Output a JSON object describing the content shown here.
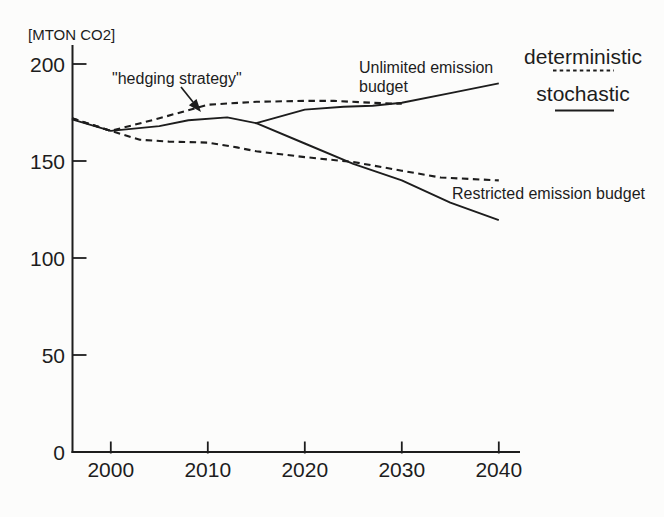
{
  "figure": {
    "paper_color": "#fcfcfb",
    "ink_color": "#1d1d1d",
    "y_axis_unit_label": "[MTON CO2]",
    "annotations": {
      "hedging": "\"hedging strategy\"",
      "unlimited_line1": "Unlimited emission",
      "unlimited_line2": "budget",
      "restricted": "Restricted emission budget"
    },
    "legend": {
      "deterministic_label": "deterministic",
      "stochastic_label": "stochastic"
    }
  },
  "chart_data": {
    "type": "line",
    "title": "",
    "xlabel": "",
    "ylabel": "[MTON CO2]",
    "x_ticks": [
      2000,
      2010,
      2020,
      2030,
      2040
    ],
    "y_ticks": [
      0,
      50,
      100,
      150,
      200
    ],
    "xlim": [
      1996,
      2042
    ],
    "ylim": [
      0,
      209
    ],
    "grid": false,
    "legend_position": "top-right",
    "legend_entries": [
      {
        "label": "deterministic",
        "style": "dashed"
      },
      {
        "label": "stochastic",
        "style": "solid"
      }
    ],
    "series": [
      {
        "name": "deterministic - unlimited emission budget",
        "style": "dashed",
        "x": [
          1996,
          2000,
          2005,
          2010,
          2015,
          2020,
          2023,
          2027,
          2030
        ],
        "y": [
          172,
          165.5,
          172,
          179,
          180.5,
          181,
          181,
          180,
          179.5
        ]
      },
      {
        "name": "deterministic - restricted emission budget",
        "style": "dashed",
        "x": [
          1996,
          2000,
          2003,
          2006,
          2010,
          2013,
          2015,
          2020,
          2025,
          2030,
          2034,
          2040
        ],
        "y": [
          172,
          165.5,
          161,
          160,
          159.5,
          157,
          155,
          152,
          149.5,
          145,
          141.5,
          140
        ]
      },
      {
        "name": "stochastic - hedging strategy then unlimited emission budget",
        "style": "solid",
        "x": [
          1996,
          2000,
          2005,
          2008,
          2012,
          2015,
          2020,
          2024,
          2027,
          2030,
          2035,
          2040
        ],
        "y": [
          171.5,
          165.5,
          168,
          171,
          172.5,
          169.5,
          176.5,
          178,
          178.5,
          180,
          185,
          190
        ]
      },
      {
        "name": "stochastic - hedging strategy then restricted emission budget",
        "style": "solid",
        "x": [
          2015,
          2020,
          2025,
          2030,
          2035,
          2040
        ],
        "y": [
          169.5,
          159,
          148.5,
          140,
          128.5,
          119.5
        ]
      }
    ]
  }
}
